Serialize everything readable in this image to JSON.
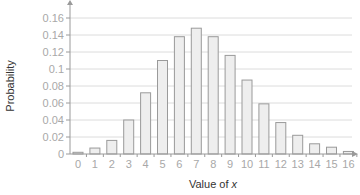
{
  "chart_data": {
    "type": "bar",
    "title": "",
    "xlabel": "Value of x",
    "xlabel_parts": {
      "text": "Value of ",
      "var": "x"
    },
    "ylabel": "Probability",
    "categories": [
      "0",
      "1",
      "2",
      "3",
      "4",
      "5",
      "6",
      "7",
      "8",
      "9",
      "10",
      "11",
      "12",
      "13",
      "14",
      "15",
      "16"
    ],
    "values": [
      0.002,
      0.007,
      0.016,
      0.04,
      0.072,
      0.11,
      0.138,
      0.148,
      0.138,
      0.116,
      0.087,
      0.059,
      0.037,
      0.022,
      0.012,
      0.008,
      0.003
    ],
    "yticks": [
      0,
      0.02,
      0.04,
      0.06,
      0.08,
      0.1,
      0.12,
      0.14,
      0.16
    ],
    "ytick_labels": [
      "0",
      "0.02",
      "0.04",
      "0.06",
      "0.08",
      "0.1",
      "0.12",
      "0.14",
      "0.16"
    ],
    "ylim": [
      0,
      0.17
    ],
    "grid": true,
    "legend": null,
    "colors": {
      "bar_fill": "#eeeeee",
      "bar_stroke": "#9a9a9a",
      "grid": "#dcdcdc",
      "axis": "#9a9a9a",
      "tick_label": "#a8a8a8",
      "axis_title": "#333333"
    }
  }
}
